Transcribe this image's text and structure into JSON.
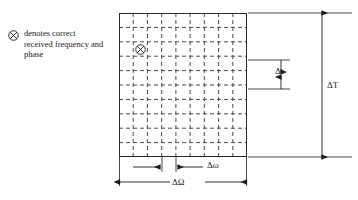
{
  "figure": {
    "type": "time-frequency-cell-grid",
    "legend": {
      "symbol_name": "circled-x-symbol",
      "text": "denotes correct received frequency and phase"
    },
    "grid": {
      "columns": 9,
      "rows": 10,
      "line_style": "dashed",
      "border_color": "#2a2a2a",
      "line_color": "#4a4a4a",
      "marker": {
        "name": "circled-x-marker",
        "column": 2,
        "row": 3
      }
    },
    "dimensions": {
      "delta_t": "Δt",
      "delta_T": "ΔT",
      "delta_omega": "Δω",
      "delta_Omega": "ΔΩ"
    }
  }
}
